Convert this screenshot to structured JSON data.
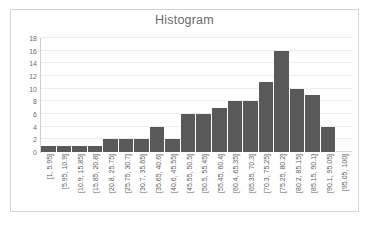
{
  "chart_data": {
    "type": "bar",
    "title": "Histogram",
    "xlabel": "",
    "ylabel": "",
    "ylim": [
      0,
      18
    ],
    "y_ticks": [
      18,
      16,
      14,
      12,
      10,
      8,
      6,
      4,
      2,
      0
    ],
    "grid": true,
    "legend": null,
    "bar_color": "#595959",
    "categories": [
      "[1, 5.95]",
      "[5.95, 10.9]",
      "[10.9, 15.85]",
      "[15.85, 20.8]",
      "[20.8, 25.75]",
      "[25.75, 30.7]",
      "[30.7, 35.65]",
      "[35.65, 40.6]",
      "[40.6, 45.55]",
      "[45.55, 50.5]",
      "[50.5, 55.45]",
      "[55.45, 60.4]",
      "[60.4, 65.35]",
      "[65.35, 70.3]",
      "[70.3, 75.25]",
      "[75.25, 80.2]",
      "[80.2, 85.15]",
      "[85.15, 90.1]",
      "[90.1, 95.05]",
      "[95.05, 100]"
    ],
    "values": [
      1,
      1,
      1,
      1,
      2,
      2,
      2,
      4,
      2,
      6,
      6,
      7,
      8,
      8,
      11,
      16,
      10,
      9,
      4,
      0
    ]
  }
}
